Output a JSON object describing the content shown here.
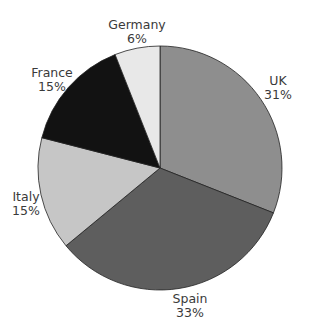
{
  "chart_data": {
    "type": "pie",
    "title": "",
    "start_angle": "12 o'clock",
    "direction": "clockwise",
    "categories": [
      "UK",
      "Spain",
      "Italy",
      "France",
      "Germany"
    ],
    "values": [
      31,
      33,
      15,
      15,
      6
    ],
    "unit": "%",
    "colors": [
      "#8e8e8e",
      "#5e5e5e",
      "#c6c6c6",
      "#121212",
      "#e8e8e8"
    ],
    "legend": "none (direct labels)"
  },
  "labels": [
    {
      "name": "UK",
      "pct": "31%",
      "x": 278,
      "y": 74
    },
    {
      "name": "Spain",
      "pct": "33%",
      "x": 190,
      "y": 292
    },
    {
      "name": "Italy",
      "pct": "15%",
      "x": 26,
      "y": 190
    },
    {
      "name": "France",
      "pct": "15%",
      "x": 52,
      "y": 66
    },
    {
      "name": "Germany",
      "pct": "6%",
      "x": 137,
      "y": 18
    }
  ]
}
